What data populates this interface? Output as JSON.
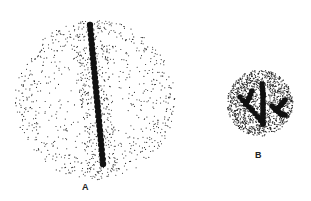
{
  "figure": {
    "panels": [
      {
        "id": "A",
        "label": "A",
        "description": "Large stippled cell with a straight chain of dark beads inside a dense elongated band",
        "cell": {
          "cx": 95,
          "cy": 100,
          "r": 80
        },
        "band": {
          "x1": 88,
          "y1": 18,
          "x2": 103,
          "y2": 170,
          "halfwidth": 16
        },
        "chain": {
          "x1": 90,
          "y1": 25,
          "x2": 103,
          "y2": 164,
          "beads": 30,
          "bead_r": 3.2
        }
      },
      {
        "id": "B",
        "label": "B",
        "description": "Small densely stippled cell with branching bead chains",
        "cell": {
          "cx": 260,
          "cy": 103,
          "r": 33
        },
        "chains": [
          [
            [
              262,
              84
            ],
            [
              263,
              94
            ],
            [
              263,
              104
            ],
            [
              263,
              114
            ],
            [
              263,
              124
            ]
          ],
          [
            [
              240,
              97
            ],
            [
              246,
              104
            ],
            [
              252,
              110
            ],
            [
              258,
              117
            ],
            [
              263,
              124
            ]
          ],
          [
            [
              252,
              91
            ],
            [
              249,
              98
            ],
            [
              246,
              104
            ]
          ],
          [
            [
              285,
              100
            ],
            [
              281,
              105
            ],
            [
              276,
              110
            ],
            [
              272,
              106
            ]
          ],
          [
            [
              276,
              110
            ],
            [
              281,
              114
            ],
            [
              285,
              115
            ]
          ]
        ],
        "bead_r": 2.8
      }
    ],
    "colors": {
      "ink": "#111111",
      "stipple": "#222222",
      "background": "#ffffff"
    }
  }
}
